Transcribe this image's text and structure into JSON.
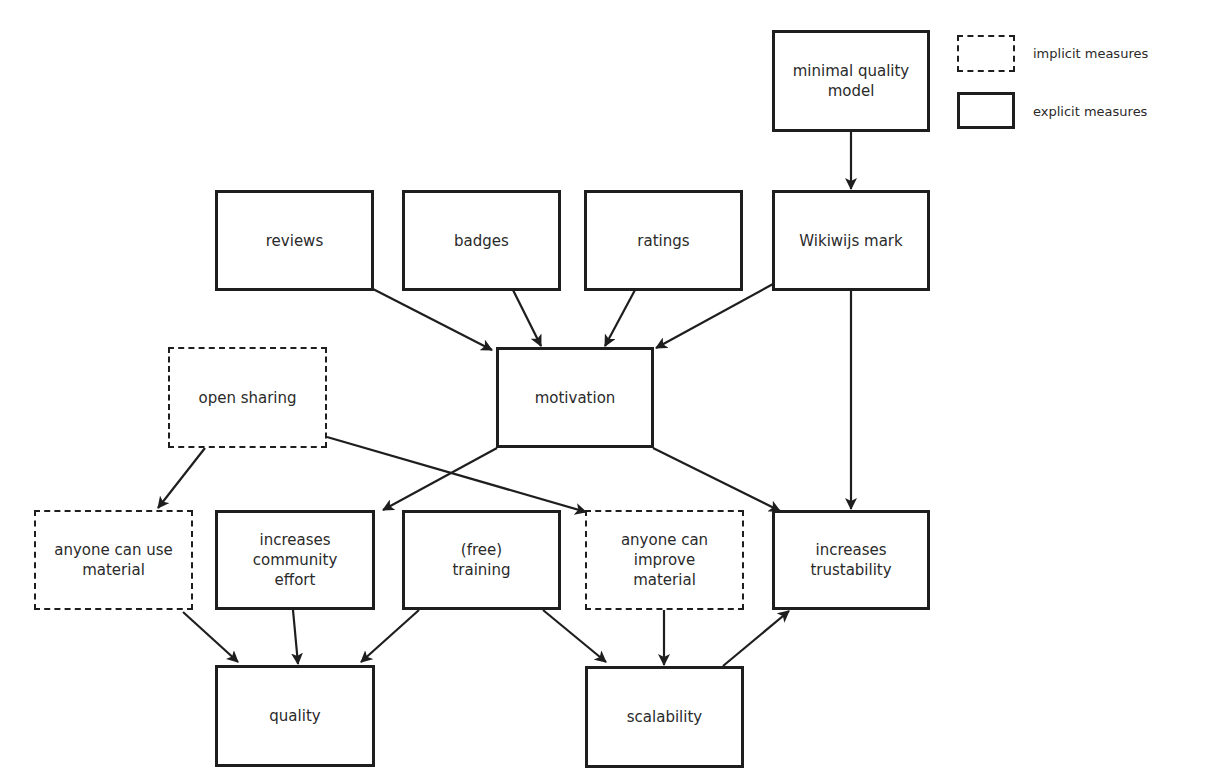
{
  "legend": {
    "implicit_label": "implicit measures",
    "explicit_label": "explicit measures"
  },
  "nodes": {
    "minimal_quality_model": "minimal quality\nmodel",
    "reviews": "reviews",
    "badges": "badges",
    "ratings": "ratings",
    "wikiwijs_mark": "Wikiwijs mark",
    "open_sharing": "open sharing",
    "motivation": "motivation",
    "anyone_can_use_material": "anyone can use\nmaterial",
    "increases_community_effort": "increases\ncommunity\neffort",
    "free_training": "(free)\ntraining",
    "anyone_can_improve_material": "anyone can\nimprove\nmaterial",
    "increases_trustability": "increases\ntrustability",
    "quality": "quality",
    "scalability": "scalability"
  },
  "node_types": {
    "minimal_quality_model": "explicit",
    "reviews": "explicit",
    "badges": "explicit",
    "ratings": "explicit",
    "wikiwijs_mark": "explicit",
    "open_sharing": "implicit",
    "motivation": "explicit",
    "anyone_can_use_material": "implicit",
    "increases_community_effort": "explicit",
    "free_training": "explicit",
    "anyone_can_improve_material": "implicit",
    "increases_trustability": "explicit",
    "quality": "explicit",
    "scalability": "explicit"
  },
  "edges": [
    {
      "from": "minimal quality model",
      "to": "Wikiwijs mark"
    },
    {
      "from": "reviews",
      "to": "motivation"
    },
    {
      "from": "badges",
      "to": "motivation"
    },
    {
      "from": "ratings",
      "to": "motivation"
    },
    {
      "from": "Wikiwijs mark",
      "to": "motivation"
    },
    {
      "from": "Wikiwijs mark",
      "to": "increases trustability"
    },
    {
      "from": "open sharing",
      "to": "anyone can use material"
    },
    {
      "from": "open sharing",
      "to": "anyone can improve material"
    },
    {
      "from": "motivation",
      "to": "increases community effort"
    },
    {
      "from": "motivation",
      "to": "increases trustability"
    },
    {
      "from": "anyone can use material",
      "to": "quality"
    },
    {
      "from": "increases community effort",
      "to": "quality"
    },
    {
      "from": "(free) training",
      "to": "quality"
    },
    {
      "from": "(free) training",
      "to": "scalability"
    },
    {
      "from": "anyone can improve material",
      "to": "scalability"
    },
    {
      "from": "scalability",
      "to": "increases trustability"
    }
  ],
  "colors": {
    "stroke": "#1e1e1e",
    "text": "#2a2a2a",
    "background": "#ffffff"
  }
}
